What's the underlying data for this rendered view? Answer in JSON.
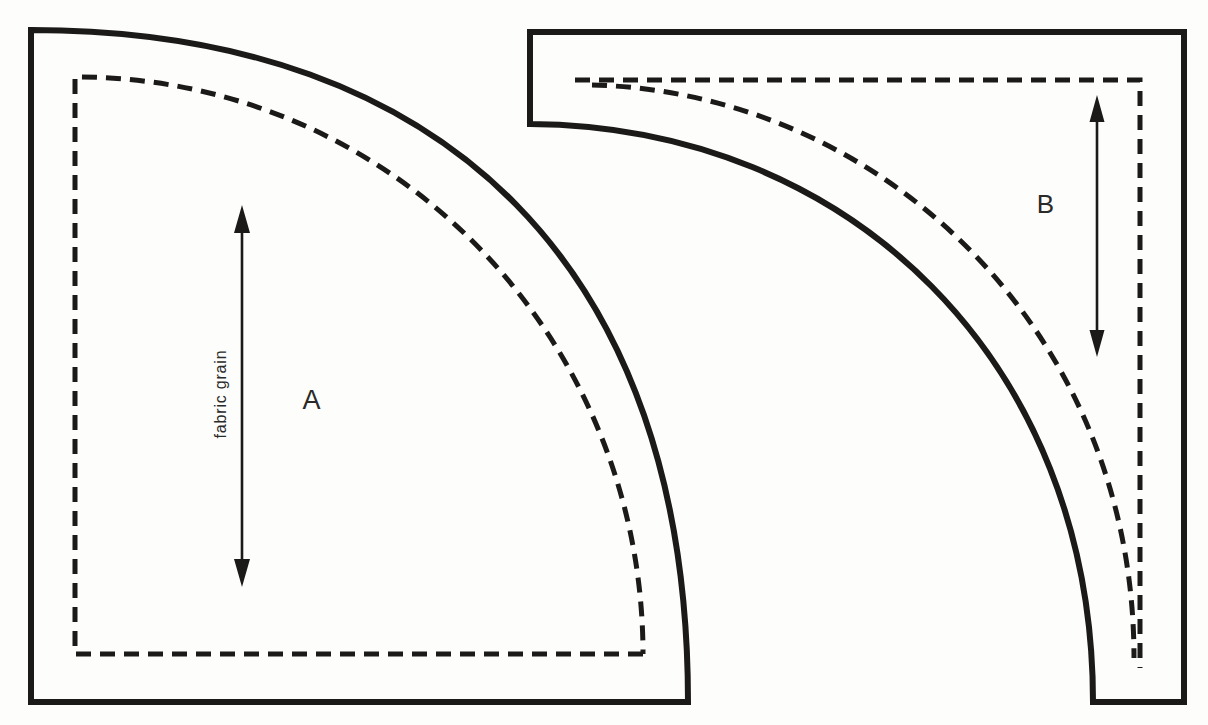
{
  "diagram": {
    "background_color": "#fdfdfc",
    "ink_color": "#1b1a18",
    "pieces": {
      "a": {
        "label": "A",
        "grain_label": "fabric grain",
        "grain_arrow_icon": "double-headed-vertical-arrow",
        "outline_path": "M 31 30 C 449 30 688 272 688 702 L 31 702 Z",
        "seam_path": "M 643 654 L 75 654 L 75 77 A 566 577 0 0 1 643 654",
        "arrow_shaft_path": "M 242 220 L 242 572",
        "arrow_heads_path": "M 242 205 L 234 233 L 250 233 Z M 242 587 L 234 559 L 250 559 Z"
      },
      "b": {
        "label": "B",
        "arrow_icon": "double-headed-vertical-arrow",
        "outline_path": "M 530 124 L 530 32 L 1184 32 L 1184 702 L 1093 702 C 1093 362 850 126 530 124 Z",
        "seam_edge_path": "M 575 80 L 1140 80 L 1140 668",
        "seam_curve_path": "M 592 85 C 880 92 1134 330 1134 658",
        "arrow_shaft_path": "M 1097 109 L 1097 343",
        "arrow_heads_path": "M 1097 95 L 1089.5 122 L 1104.5 122 Z M 1097 357 L 1089.5 330 L 1104.5 330 Z"
      }
    }
  }
}
